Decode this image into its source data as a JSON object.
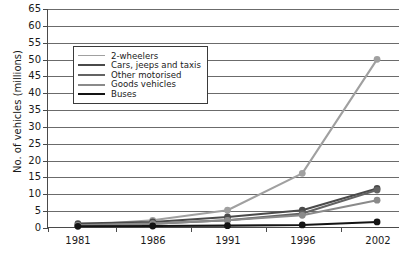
{
  "chart_data": {
    "type": "line",
    "title": "",
    "xlabel": "",
    "ylabel": "No. of vehicles (millions)",
    "categories": [
      "1981",
      "1986",
      "1991",
      "1996",
      "2002"
    ],
    "x": [
      1981,
      1986,
      1991,
      1996,
      2002
    ],
    "ylim": [
      0,
      65
    ],
    "ytick_step": 5,
    "yticks": [
      "0",
      "5",
      "10",
      "15",
      "20",
      "25",
      "30",
      "35",
      "40",
      "45",
      "50",
      "55",
      "60",
      "65"
    ],
    "grid": "horizontal",
    "legend_position": "upper-left-inside",
    "markers": "circle",
    "series": [
      {
        "name": "2-wheelers",
        "values": [
          0.5,
          2.0,
          5.0,
          16.0,
          50.0
        ],
        "color": "#a0a0a0"
      },
      {
        "name": "Cars, jeeps and taxis",
        "values": [
          1.0,
          1.5,
          3.0,
          5.0,
          11.5
        ],
        "color": "#4a4a4a"
      },
      {
        "name": "Other motorised",
        "values": [
          0.5,
          1.0,
          2.0,
          4.0,
          11.0
        ],
        "color": "#636363"
      },
      {
        "name": "Goods vehicles",
        "values": [
          0.5,
          1.0,
          2.0,
          3.5,
          8.0
        ],
        "color": "#8a8a8a"
      },
      {
        "name": "Buses",
        "values": [
          0.2,
          0.3,
          0.4,
          0.6,
          1.5
        ],
        "color": "#141414"
      }
    ]
  },
  "axis": {
    "y_title": "No. of vehicles (millions)"
  },
  "colors": {
    "axis": "#4a4a4a",
    "grid": "#6b6b6b",
    "text": "#1a1a1a",
    "background": "#ffffff",
    "legend_border": "#3a3a3a"
  }
}
